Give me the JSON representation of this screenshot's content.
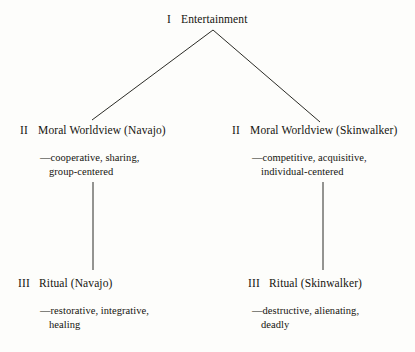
{
  "diagram": {
    "type": "hierarchy-tree",
    "line_color": "#2b2b26",
    "text_color": "#15140f",
    "background_color": "#fdfdfb",
    "nodes": {
      "root": {
        "numeral": "I",
        "label": "Entertainment"
      },
      "level2_left": {
        "numeral": "II",
        "label": "Moral Worldview (Navajo)",
        "descriptor_line1": "—cooperative, sharing,",
        "descriptor_line2": "group-centered"
      },
      "level2_right": {
        "numeral": "II",
        "label": "Moral Worldview (Skinwalker)",
        "descriptor_line1": "—competitive, acquisitive,",
        "descriptor_line2": "individual-centered"
      },
      "level3_left": {
        "numeral": "III",
        "label": "Ritual (Navajo)",
        "descriptor_line1": "—restorative, integrative,",
        "descriptor_line2": "healing"
      },
      "level3_right": {
        "numeral": "III",
        "label": "Ritual (Skinwalker)",
        "descriptor_line1": "—destructive, alienating,",
        "descriptor_line2": "deadly"
      }
    },
    "edges": [
      {
        "name": "apex-to-left",
        "x1": 213,
        "y1": 30,
        "x2": 92,
        "y2": 120
      },
      {
        "name": "apex-to-right",
        "x1": 213,
        "y1": 30,
        "x2": 320,
        "y2": 122
      },
      {
        "name": "left-vertical",
        "x1": 93,
        "y1": 182,
        "x2": 93,
        "y2": 270
      },
      {
        "name": "right-vertical",
        "x1": 323,
        "y1": 182,
        "x2": 323,
        "y2": 270
      }
    ]
  }
}
